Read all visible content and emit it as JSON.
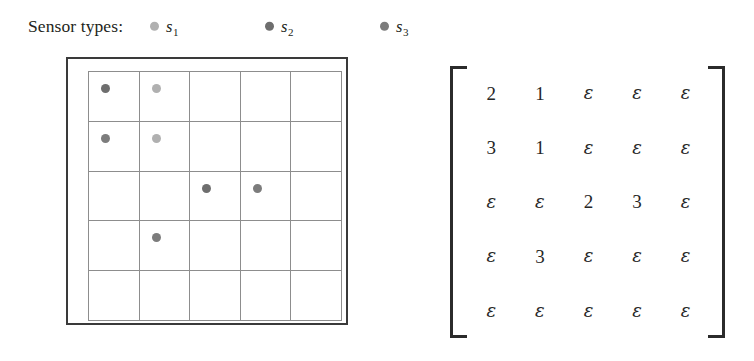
{
  "legend": {
    "label": "Sensor types:",
    "entries": [
      {
        "name": "s",
        "subscript": "1",
        "color": "#b0b0b0",
        "x": 150
      },
      {
        "name": "s",
        "subscript": "2",
        "color": "#6e6e6e",
        "x": 265
      },
      {
        "name": "s",
        "subscript": "3",
        "color": "#7c7c7c",
        "x": 380
      }
    ]
  },
  "grid": {
    "rows": 5,
    "cols": 5,
    "cells": [
      [
        "s2",
        "s1",
        "",
        "",
        ""
      ],
      [
        "s3",
        "s1",
        "",
        "",
        ""
      ],
      [
        "",
        "",
        "s2",
        "s3",
        ""
      ],
      [
        "",
        "s3",
        "",
        "",
        ""
      ],
      [
        "",
        "",
        "",
        "",
        ""
      ]
    ],
    "colors": {
      "s1": "#b0b0b0",
      "s2": "#6e6e6e",
      "s3": "#7c7c7c"
    }
  },
  "matrix": {
    "empty_symbol": "ε",
    "rows": [
      [
        "2",
        "1",
        "ε",
        "ε",
        "ε"
      ],
      [
        "3",
        "1",
        "ε",
        "ε",
        "ε"
      ],
      [
        "ε",
        "ε",
        "2",
        "3",
        "ε"
      ],
      [
        "ε",
        "3",
        "ε",
        "ε",
        "ε"
      ],
      [
        "ε",
        "ε",
        "ε",
        "ε",
        "ε"
      ]
    ]
  },
  "colors": {
    "text": "#231f20",
    "outer_border": "#3a3a3a",
    "grid_line": "#8d8d8d",
    "bracket": "#2b2b2b"
  }
}
